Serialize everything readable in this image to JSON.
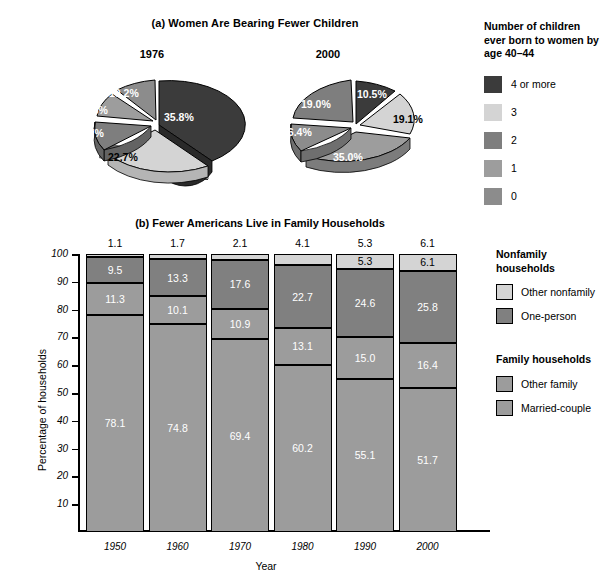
{
  "panel_a": {
    "title": "(a) Women Are Bearing Fewer Children",
    "pies": [
      {
        "year": "1976",
        "labels": [
          "35.8%",
          "22.7%",
          "21.7%",
          "9.6%",
          "10.2%"
        ]
      },
      {
        "year": "2000",
        "labels": [
          "10.5%",
          "19.1%",
          "35.0%",
          "16.4%",
          "19.0%"
        ]
      }
    ],
    "legend": {
      "title": "Number of children ever born to women by age 40–44",
      "items": [
        {
          "label": "4 or more",
          "color": "#3b3b3b"
        },
        {
          "label": "3",
          "color": "#d4d4d4"
        },
        {
          "label": "2",
          "color": "#7e7e7e"
        },
        {
          "label": "1",
          "color": "#9d9d9d"
        },
        {
          "label": "0",
          "color": "#8c8c8c"
        }
      ]
    }
  },
  "panel_b": {
    "title": "(b) Fewer Americans Live in Family Households",
    "ylabel": "Percentage of households",
    "xlabel": "Year",
    "yticks": [
      "100",
      "90",
      "80",
      "70",
      "60",
      "50",
      "40",
      "30",
      "20",
      "10"
    ],
    "legend": {
      "nonfamily_heading": "Nonfamily households",
      "family_heading": "Family households",
      "items": [
        {
          "label": "Other nonfamily",
          "color": "#d4d4d4"
        },
        {
          "label": "One-person",
          "color": "#808080"
        },
        {
          "label": "Other family",
          "color": "#9c9c9c"
        },
        {
          "label": "Married-couple",
          "color": "#9c9c9c"
        }
      ]
    }
  },
  "chart_data": [
    {
      "type": "pie",
      "title": "1976",
      "subtitle": "(a) Women Are Bearing Fewer Children",
      "categories": [
        "4 or more",
        "3",
        "2",
        "1",
        "0"
      ],
      "values": [
        35.8,
        22.7,
        21.7,
        9.6,
        10.2
      ],
      "labels": [
        "35.8%",
        "22.7%",
        "21.7%",
        "9.6%",
        "10.2%"
      ],
      "colors": [
        "#3b3b3b",
        "#d4d4d4",
        "#7e7e7e",
        "#9d9d9d",
        "#8c8c8c"
      ],
      "legend_title": "Number of children ever born to women by age 40–44",
      "legend_position": "right"
    },
    {
      "type": "pie",
      "title": "2000",
      "subtitle": "(a) Women Are Bearing Fewer Children",
      "categories": [
        "4 or more",
        "3",
        "2",
        "1",
        "0"
      ],
      "values": [
        10.5,
        19.1,
        19.0,
        35.0,
        16.4
      ],
      "labels": [
        "10.5%",
        "19.1%",
        "19.0%",
        "35.0%",
        "16.4%"
      ],
      "colors": [
        "#3b3b3b",
        "#d4d4d4",
        "#7e7e7e",
        "#9d9d9d",
        "#8c8c8c"
      ],
      "legend_title": "Number of children ever born to women by age 40–44",
      "legend_position": "right"
    },
    {
      "type": "bar",
      "stacked": true,
      "title": "(b) Fewer Americans Live in Family Households",
      "xlabel": "Year",
      "ylabel": "Percentage of households",
      "ylim": [
        0,
        100
      ],
      "yticks": [
        10,
        20,
        30,
        40,
        50,
        60,
        70,
        80,
        90,
        100
      ],
      "grid": false,
      "legend_position": "right",
      "categories": [
        "1950",
        "1960",
        "1970",
        "1980",
        "1990",
        "2000"
      ],
      "series": [
        {
          "name": "Married-couple",
          "color": "#9c9c9c",
          "values": [
            78.1,
            74.8,
            69.4,
            60.2,
            55.1,
            51.7
          ]
        },
        {
          "name": "Other family",
          "color": "#9c9c9c",
          "values": [
            11.3,
            10.1,
            10.9,
            13.1,
            15.0,
            16.4
          ]
        },
        {
          "name": "One-person",
          "color": "#808080",
          "values": [
            9.5,
            13.3,
            17.6,
            22.7,
            24.6,
            25.8
          ]
        },
        {
          "name": "Other nonfamily",
          "color": "#d4d4d4",
          "values": [
            1.1,
            1.7,
            2.1,
            4.1,
            5.3,
            6.1
          ]
        }
      ],
      "top_labels": [
        "1.1",
        "1.7",
        "2.1",
        "4.1",
        "5.3",
        "6.1"
      ]
    }
  ]
}
